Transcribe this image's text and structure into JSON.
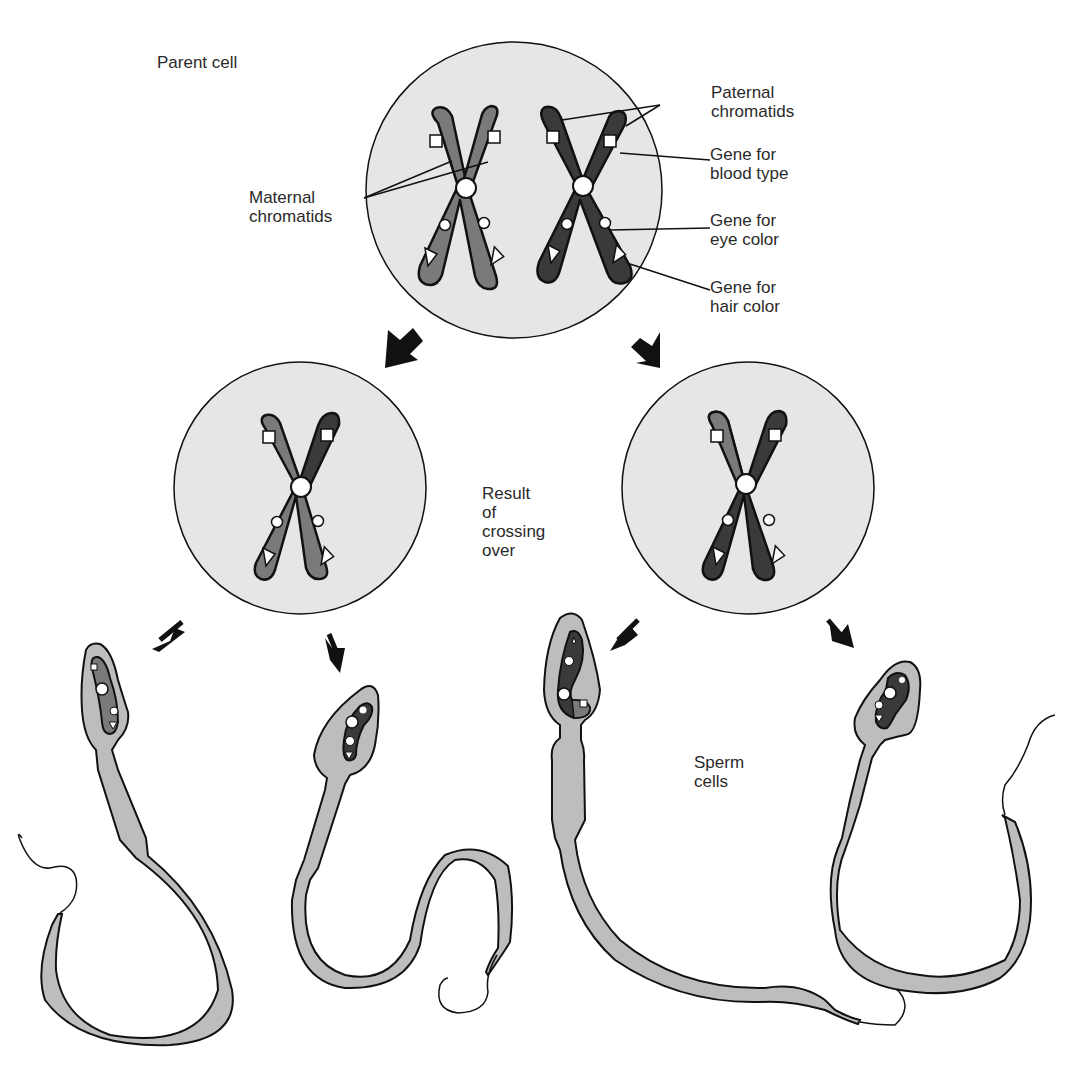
{
  "labels": {
    "parent_cell": "Parent  cell",
    "maternal_chromatids": "Maternal\nchromatids",
    "paternal_chromatids": "Paternal\nchromatids",
    "gene_blood_type": "Gene for\nblood type",
    "gene_eye_color": "Gene for\neye color",
    "gene_hair_color": "Gene for\nhair color",
    "result_crossing_over": "Result\nof\ncrossing\nover",
    "sperm_cells": "Sperm\ncells"
  },
  "colors": {
    "cell_fill": "#e6e6e6",
    "maternal": "#7a7a7a",
    "paternal": "#3a3a3a",
    "sperm_body": "#bdbdbd",
    "outline": "#111111",
    "background": "#ffffff"
  },
  "gene_markers": {
    "blood_type": "square",
    "eye_color": "circle",
    "hair_color": "triangle"
  }
}
